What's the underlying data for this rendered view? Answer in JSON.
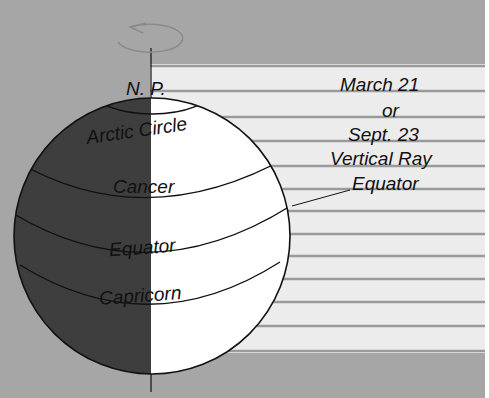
{
  "diagram": {
    "type": "equinox-sun-rays-on-earth",
    "colors": {
      "background": "#a6a6a6",
      "ray_band": "#ececec",
      "ray_line": "#9a9a9a",
      "night_side": "#3e3e3e",
      "day_side": "#ffffff",
      "outline": "#111111",
      "rotation_arrow": "#8a8a8a"
    },
    "globe_labels": {
      "north_pole": "N. P.",
      "arctic_circle": "Arctic Circle",
      "cancer": "Cancer",
      "equator": "Equator",
      "capricorn": "Capricorn"
    },
    "annotation": {
      "line1": "March 21",
      "line2": "or",
      "line3": "Sept. 23",
      "line4": "Vertical Ray",
      "line5": "Equator"
    },
    "icons": [
      "rotation-arrow-icon"
    ]
  }
}
